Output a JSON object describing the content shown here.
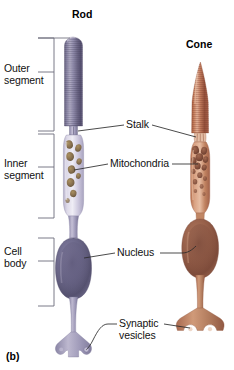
{
  "figure": {
    "panel_label": "(b)",
    "titles": [
      {
        "name": "rod-title",
        "text": "Rod",
        "x": 72,
        "y": 8
      },
      {
        "name": "cone-title",
        "text": "Cone",
        "x": 186,
        "y": 38
      }
    ],
    "left_labels": [
      {
        "name": "outer-segment",
        "text": "Outer\nsegment",
        "x": 4,
        "y": 64
      },
      {
        "name": "inner-segment",
        "text": "Inner\nsegment",
        "x": 4,
        "y": 155
      },
      {
        "name": "cell-body",
        "text": "Cell\nbody",
        "x": 4,
        "y": 244
      }
    ],
    "right_labels": [
      {
        "name": "stalk",
        "text": "Stalk",
        "x": 126,
        "y": 123
      },
      {
        "name": "mitochondria",
        "text": "Mitochondria",
        "x": 110,
        "y": 160
      },
      {
        "name": "nucleus",
        "text": "Nucleus",
        "x": 117,
        "y": 249
      },
      {
        "name": "synaptic-vesicles",
        "text": "Synaptic\nvesicles",
        "x": 119,
        "y": 320
      }
    ],
    "brackets": [
      {
        "name": "bracket-outer-segment",
        "top": 38,
        "bottom": 131,
        "x": 54,
        "tick": 72
      },
      {
        "name": "bracket-inner-segment",
        "top": 134,
        "bottom": 218,
        "x": 54,
        "tick": 167
      },
      {
        "name": "bracket-cell-body",
        "top": 238,
        "bottom": 306,
        "x": 54,
        "tick": 261
      }
    ],
    "cells": [
      {
        "name": "rod-cell",
        "type": "rod",
        "parts": [
          "outer-segment",
          "stalk",
          "inner-segment",
          "mitochondria",
          "nucleus",
          "cell-body",
          "axon",
          "synaptic-terminal",
          "synaptic-vesicles"
        ]
      },
      {
        "name": "cone-cell",
        "type": "cone",
        "parts": [
          "outer-segment",
          "stalk",
          "inner-segment",
          "mitochondria",
          "nucleus",
          "cell-body",
          "axon",
          "synaptic-terminal",
          "synaptic-vesicles"
        ]
      }
    ],
    "colors": {
      "rod_outer_dark": "#565070",
      "rod_outer_mid": "#8b86a8",
      "rod_outer_light": "#b6b2c9",
      "rod_inner": "#cfcade",
      "rod_inner_light": "#e6e3ef",
      "rod_body_dark": "#4e4a66",
      "rod_body_mid": "#807ba0",
      "rod_terminal": "#9e9ab8",
      "rod_mito": "#8a7552",
      "cone_outer_dark": "#8c4a33",
      "cone_outer_mid": "#c07a5e",
      "cone_outer_light": "#e0ad93",
      "cone_inner": "#c98a6b",
      "cone_inner_light": "#dcb095",
      "cone_body_dark": "#7d4b3a",
      "cone_body_mid": "#a9705a",
      "cone_terminal": "#bc8466",
      "cone_mito": "#8d5740",
      "leader_line": "#2b2b2b",
      "bracket_line": "#6c6c7a",
      "text": "#111111",
      "background": "#ffffff"
    }
  }
}
